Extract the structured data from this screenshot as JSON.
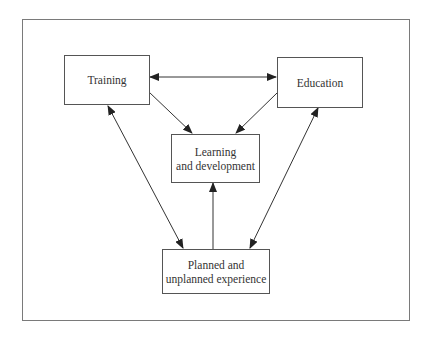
{
  "diagram": {
    "type": "flow",
    "nodes": [
      {
        "id": "training",
        "label": "Training"
      },
      {
        "id": "education",
        "label": "Education"
      },
      {
        "id": "learning",
        "label": "Learning\nand development"
      },
      {
        "id": "experience",
        "label": "Planned and\nunplanned experience"
      }
    ],
    "edges": [
      {
        "from": "training",
        "to": "education",
        "bidirectional": true
      },
      {
        "from": "training",
        "to": "learning",
        "bidirectional": false
      },
      {
        "from": "education",
        "to": "learning",
        "bidirectional": false
      },
      {
        "from": "experience",
        "to": "learning",
        "bidirectional": false
      },
      {
        "from": "training",
        "to": "experience",
        "bidirectional": true
      },
      {
        "from": "education",
        "to": "experience",
        "bidirectional": true
      }
    ],
    "colors": {
      "line": "#333333",
      "border": "#555555",
      "frame": "#7a7a7a"
    }
  }
}
